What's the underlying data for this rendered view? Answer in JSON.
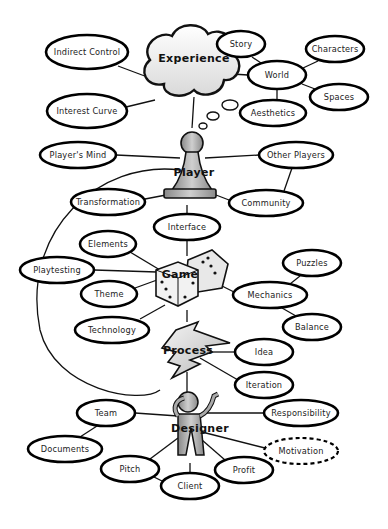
{
  "diagram": {
    "hubs": {
      "experience": {
        "label": "Experience",
        "shape": "cloud",
        "x": 194,
        "y": 55
      },
      "player": {
        "label": "Player",
        "shape": "pawn",
        "x": 192,
        "y": 170
      },
      "game": {
        "label": "Game",
        "shape": "dice",
        "x": 185,
        "y": 275
      },
      "process": {
        "label": "Process",
        "shape": "lightning",
        "x": 185,
        "y": 350
      },
      "designer": {
        "label": "Designer",
        "shape": "person",
        "x": 190,
        "y": 428
      }
    },
    "nodes": [
      {
        "id": "indirect-control",
        "label": "Indirect Control",
        "x": 87,
        "y": 52,
        "rx": 41,
        "ry": 17
      },
      {
        "id": "interest-curve",
        "label": "Interest Curve",
        "x": 87,
        "y": 111,
        "rx": 40,
        "ry": 17
      },
      {
        "id": "story",
        "label": "Story",
        "x": 241,
        "y": 44,
        "rx": 24,
        "ry": 13
      },
      {
        "id": "world",
        "label": "World",
        "x": 277,
        "y": 75,
        "rx": 29,
        "ry": 14
      },
      {
        "id": "characters",
        "label": "Characters",
        "x": 335,
        "y": 49,
        "rx": 29,
        "ry": 13
      },
      {
        "id": "spaces",
        "label": "Spaces",
        "x": 339,
        "y": 97,
        "rx": 29,
        "ry": 13
      },
      {
        "id": "aesthetics",
        "label": "Aesthetics",
        "x": 273,
        "y": 113,
        "rx": 33,
        "ry": 13
      },
      {
        "id": "players-mind",
        "label": "Player's Mind",
        "x": 78,
        "y": 155,
        "rx": 38,
        "ry": 13
      },
      {
        "id": "other-players",
        "label": "Other Players",
        "x": 296,
        "y": 155,
        "rx": 37,
        "ry": 13
      },
      {
        "id": "transformation",
        "label": "Transformation",
        "x": 108,
        "y": 202,
        "rx": 37,
        "ry": 13
      },
      {
        "id": "community",
        "label": "Community",
        "x": 266,
        "y": 203,
        "rx": 37,
        "ry": 13
      },
      {
        "id": "interface",
        "label": "Interface",
        "x": 187,
        "y": 227,
        "rx": 33,
        "ry": 13
      },
      {
        "id": "elements",
        "label": "Elements",
        "x": 108,
        "y": 244,
        "rx": 28,
        "ry": 13
      },
      {
        "id": "playtesting",
        "label": "Playtesting",
        "x": 57,
        "y": 270,
        "rx": 37,
        "ry": 13
      },
      {
        "id": "puzzles",
        "label": "Puzzles",
        "x": 312,
        "y": 263,
        "rx": 29,
        "ry": 13
      },
      {
        "id": "theme",
        "label": "Theme",
        "x": 109,
        "y": 294,
        "rx": 28,
        "ry": 13
      },
      {
        "id": "mechanics",
        "label": "Mechanics",
        "x": 270,
        "y": 295,
        "rx": 37,
        "ry": 13
      },
      {
        "id": "technology",
        "label": "Technology",
        "x": 112,
        "y": 330,
        "rx": 37,
        "ry": 13
      },
      {
        "id": "balance",
        "label": "Balance",
        "x": 312,
        "y": 327,
        "rx": 29,
        "ry": 13
      },
      {
        "id": "idea",
        "label": "Idea",
        "x": 264,
        "y": 352,
        "rx": 29,
        "ry": 13
      },
      {
        "id": "iteration",
        "label": "Iteration",
        "x": 264,
        "y": 385,
        "rx": 29,
        "ry": 13
      },
      {
        "id": "team",
        "label": "Team",
        "x": 106,
        "y": 413,
        "rx": 29,
        "ry": 13
      },
      {
        "id": "responsibility",
        "label": "Responsibility",
        "x": 301,
        "y": 413,
        "rx": 37,
        "ry": 13
      },
      {
        "id": "documents",
        "label": "Documents",
        "x": 65,
        "y": 449,
        "rx": 37,
        "ry": 13
      },
      {
        "id": "motivation",
        "label": "Motivation",
        "x": 301,
        "y": 451,
        "rx": 37,
        "ry": 13,
        "dashed": true
      },
      {
        "id": "pitch",
        "label": "Pitch",
        "x": 130,
        "y": 469,
        "rx": 29,
        "ry": 13
      },
      {
        "id": "profit",
        "label": "Profit",
        "x": 244,
        "y": 470,
        "rx": 29,
        "ry": 13
      },
      {
        "id": "client",
        "label": "Client",
        "x": 190,
        "y": 486,
        "rx": 29,
        "ry": 13
      }
    ]
  }
}
